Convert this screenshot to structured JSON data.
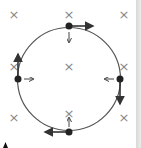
{
  "diagram": {
    "field_symbol": "×",
    "field_marks": [
      {
        "x": 14,
        "y": 14
      },
      {
        "x": 69,
        "y": 14
      },
      {
        "x": 124,
        "y": 14
      },
      {
        "x": 14,
        "y": 66
      },
      {
        "x": 69,
        "y": 66
      },
      {
        "x": 124,
        "y": 66
      },
      {
        "x": 14,
        "y": 117
      },
      {
        "x": 69,
        "y": 113
      },
      {
        "x": 124,
        "y": 117
      }
    ],
    "circle": {
      "cx": 69,
      "cy": 79,
      "r": 52
    },
    "particles": [
      {
        "position": "top",
        "x": 69,
        "y": 26,
        "velocity": "right",
        "force": "down"
      },
      {
        "position": "right",
        "x": 120,
        "y": 79,
        "velocity": "down",
        "force": "left"
      },
      {
        "position": "bottom",
        "x": 69,
        "y": 132,
        "velocity": "left",
        "force": "up"
      },
      {
        "position": "left",
        "x": 18,
        "y": 79,
        "velocity": "up",
        "force": "right"
      }
    ],
    "colors": {
      "line": "#555555",
      "dot": "#222222",
      "cross": "#888888",
      "strip": "#dcdcdc"
    }
  }
}
